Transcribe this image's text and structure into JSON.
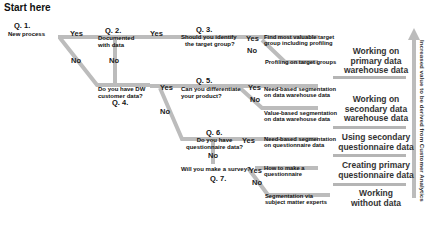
{
  "title": "Start here",
  "questions": [
    {
      "id": "q1",
      "number": "Q. 1.",
      "text": "New process"
    },
    {
      "id": "q2",
      "number": "Q. 2.",
      "text": [
        "Documented",
        "with data"
      ]
    },
    {
      "id": "q3",
      "number": "Q. 3.",
      "text": [
        "Should you identify",
        "the target group?"
      ]
    },
    {
      "id": "q4",
      "number": "Q. 4.",
      "text": [
        "Do you have DW",
        "customer data?"
      ]
    },
    {
      "id": "q5",
      "number": "Q. 5.",
      "text": [
        "Can you differentiate",
        "your product?"
      ]
    },
    {
      "id": "q6",
      "number": "Q. 6.",
      "text": [
        "Do you have",
        "questionnaire data?"
      ]
    },
    {
      "id": "q7",
      "number": "Q. 7.",
      "text": "Will you make a survey?"
    }
  ],
  "answers": {
    "yes": "Yes",
    "no": "No"
  },
  "outcomes": [
    {
      "id": "o1",
      "text": [
        "Find most valuable target",
        "group including profiling"
      ]
    },
    {
      "id": "o2",
      "text": [
        "Profiling on target groups"
      ]
    },
    {
      "id": "o3",
      "text": [
        "Need-based segmentation",
        "on data warehouse data"
      ]
    },
    {
      "id": "o4",
      "text": [
        "Value-based segmentation",
        "on data warehouse data"
      ]
    },
    {
      "id": "o5",
      "text": [
        "Need-based segmentation",
        "on questionnaire data"
      ]
    },
    {
      "id": "o6",
      "text": [
        "How to make a",
        "questionnaire"
      ]
    },
    {
      "id": "o7",
      "text": [
        "Segmentation via",
        "subject matter experts"
      ]
    }
  ],
  "categories": [
    {
      "id": "c1",
      "text": [
        "Working on",
        "primary data",
        "warehouse data"
      ]
    },
    {
      "id": "c2",
      "text": [
        "Working on",
        "secondary data",
        "warehouse data"
      ]
    },
    {
      "id": "c3",
      "text": [
        "Using secondary",
        "questionnaire data"
      ]
    },
    {
      "id": "c4",
      "text": [
        "Creating primary",
        "questionnaire data"
      ]
    },
    {
      "id": "c5",
      "text": [
        "Working",
        "without data"
      ]
    }
  ],
  "axis_label": "Increased value to be derived from Customer Analytics",
  "colors": {
    "line": "#b8b8b8",
    "text": "#111111",
    "category_text": "#333333"
  }
}
